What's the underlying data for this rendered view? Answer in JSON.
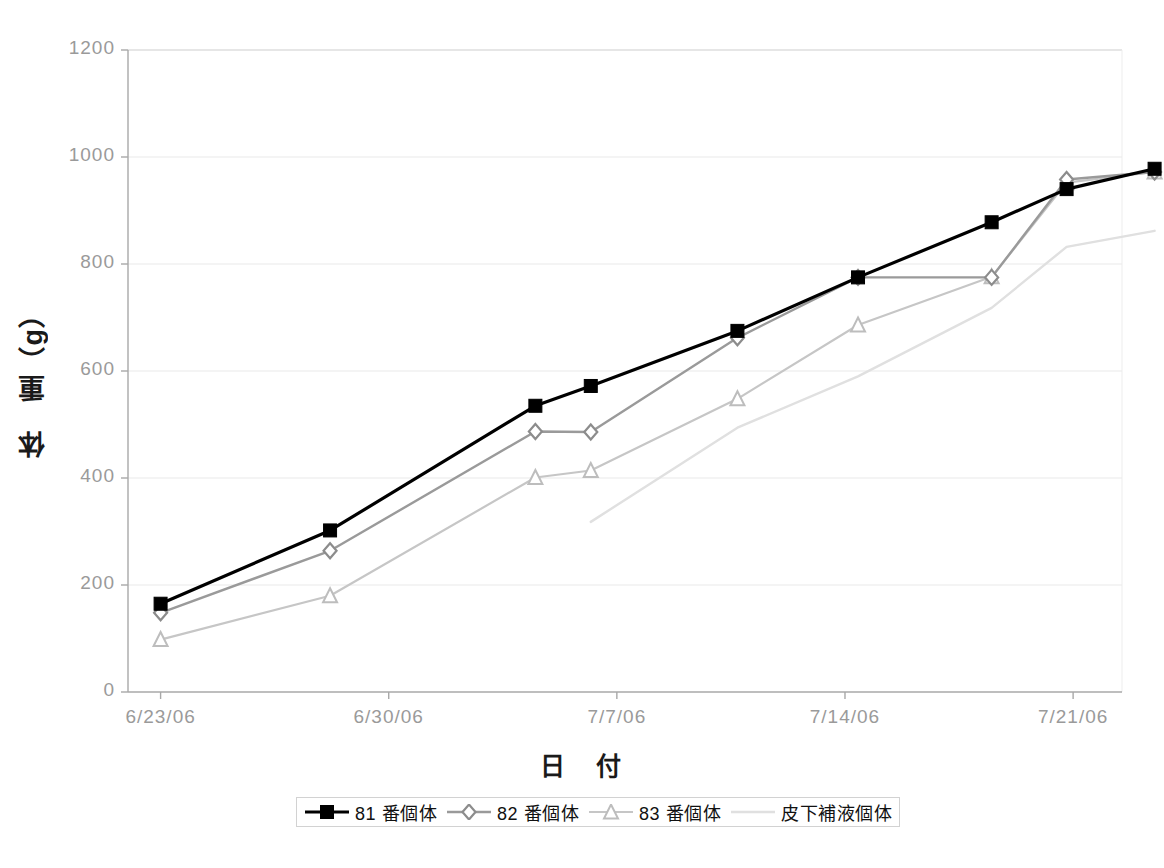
{
  "chart_data": {
    "type": "line",
    "title": "",
    "xlabel": "日　付",
    "ylabel": "体　重（g）",
    "ylim": [
      0,
      1200
    ],
    "ytick_values": [
      0,
      200,
      400,
      600,
      800,
      1000,
      1200
    ],
    "ytick_labels": [
      "0",
      "200",
      "400",
      "600",
      "800",
      "1000",
      "1200"
    ],
    "xtick_labels": [
      "6/23/06",
      "6/30/06",
      "7/7/06",
      "7/14/06",
      "7/21/06"
    ],
    "xtick_days": [
      0,
      7,
      14,
      21,
      28
    ],
    "xlim_days": [
      -1,
      29.5
    ],
    "grid": "horizontal",
    "legend_position": "bottom",
    "series": [
      {
        "name": "81 番個体",
        "color": "#000000",
        "marker": "square",
        "marker_color": "#000000",
        "line_width": 3.2,
        "x_days": [
          0,
          5.2,
          11.5,
          13.2,
          17.7,
          21.4,
          25.5,
          28
        ],
        "values": [
          165,
          302,
          535,
          572,
          675,
          775,
          878,
          940,
          978
        ],
        "points": [
          {
            "x": 0,
            "y": 165
          },
          {
            "x": 5.2,
            "y": 302
          },
          {
            "x": 11.5,
            "y": 535
          },
          {
            "x": 13.2,
            "y": 572
          },
          {
            "x": 17.7,
            "y": 675
          },
          {
            "x": 21.4,
            "y": 775
          },
          {
            "x": 25.5,
            "y": 878
          },
          {
            "x": 27.8,
            "y": 940
          },
          {
            "x": 30.5,
            "y": 978
          }
        ]
      },
      {
        "name": "82 番個体",
        "color": "#9a9a9a",
        "marker": "diamond",
        "marker_color": "#8c8c8c",
        "line_width": 2.4,
        "points": [
          {
            "x": 0,
            "y": 148
          },
          {
            "x": 5.2,
            "y": 264
          },
          {
            "x": 11.5,
            "y": 487
          },
          {
            "x": 13.2,
            "y": 486
          },
          {
            "x": 17.7,
            "y": 662
          },
          {
            "x": 21.4,
            "y": 775
          },
          {
            "x": 25.5,
            "y": 775
          },
          {
            "x": 27.8,
            "y": 958
          },
          {
            "x": 30.5,
            "y": 972
          }
        ]
      },
      {
        "name": "83 番個体",
        "color": "#c6c6c6",
        "marker": "triangle",
        "marker_color": "#bdbdbd",
        "line_width": 2.2,
        "points": [
          {
            "x": 0,
            "y": 98
          },
          {
            "x": 5.2,
            "y": 180
          },
          {
            "x": 11.5,
            "y": 401
          },
          {
            "x": 13.2,
            "y": 414
          },
          {
            "x": 17.7,
            "y": 548
          },
          {
            "x": 21.4,
            "y": 686
          },
          {
            "x": 25.5,
            "y": 776
          },
          {
            "x": 27.8,
            "y": 952
          },
          {
            "x": 30.5,
            "y": 972
          }
        ]
      },
      {
        "name": "皮下補液個体",
        "color": "#e0e0e0",
        "marker": "none",
        "marker_color": "#e0e0e0",
        "line_width": 2.4,
        "points": [
          {
            "x": 13.2,
            "y": 318
          },
          {
            "x": 17.7,
            "y": 494
          },
          {
            "x": 21.4,
            "y": 590
          },
          {
            "x": 25.5,
            "y": 718
          },
          {
            "x": 27.8,
            "y": 832
          },
          {
            "x": 30.5,
            "y": 862
          }
        ]
      }
    ]
  },
  "axes": {
    "y_title": "体　重（g）",
    "x_title": "日　付"
  }
}
